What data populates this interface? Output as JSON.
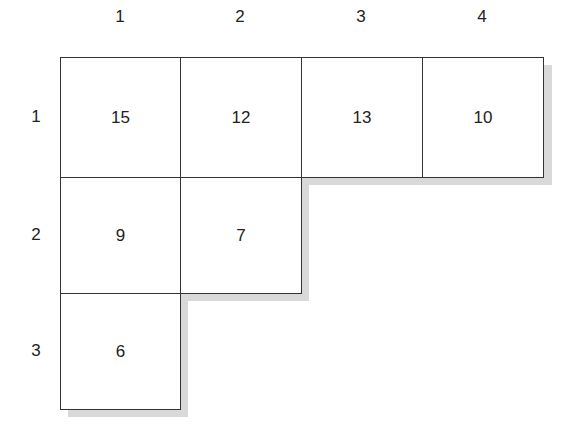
{
  "diagram": {
    "type": "young-tableau",
    "column_labels": [
      "1",
      "2",
      "3",
      "4"
    ],
    "row_labels": [
      "1",
      "2",
      "3"
    ],
    "rows": [
      [
        "15",
        "12",
        "13",
        "10"
      ],
      [
        "9",
        "7"
      ],
      [
        "6"
      ]
    ],
    "colors": {
      "border": "#333333",
      "shadow": "#d9d9d9",
      "background": "#ffffff"
    }
  }
}
